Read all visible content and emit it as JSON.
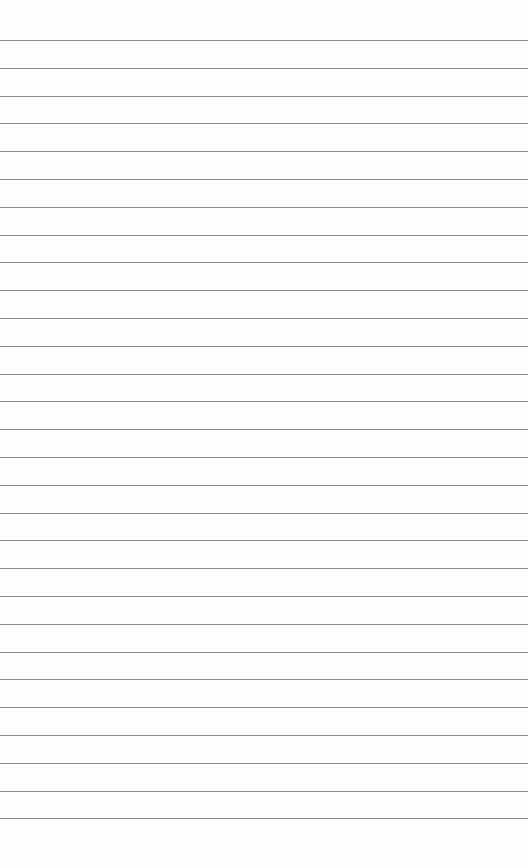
{
  "paper": {
    "type": "ruled-sheet",
    "line_count": 29,
    "first_line_y": 40,
    "line_spacing": 27.8,
    "line_color": "#8a8a8a",
    "background_color": "#fdfdfc"
  }
}
